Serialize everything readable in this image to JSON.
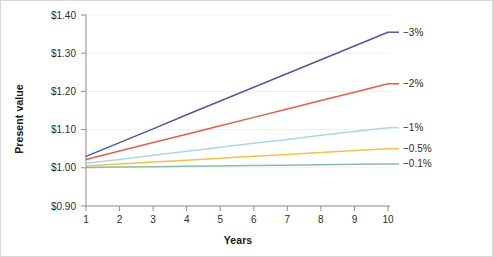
{
  "chart_data": {
    "type": "line",
    "title": "",
    "xlabel": "Years",
    "ylabel": "Present value",
    "xlim": [
      1,
      10
    ],
    "ylim": [
      0.9,
      1.4
    ],
    "grid": true,
    "legend_position": "right-inline-labels",
    "x": [
      1,
      2,
      3,
      4,
      5,
      6,
      7,
      8,
      9,
      10
    ],
    "xticklabels": [
      "1",
      "2",
      "3",
      "4",
      "5",
      "6",
      "7",
      "8",
      "9",
      "10"
    ],
    "yticks": [
      0.9,
      1.0,
      1.1,
      1.2,
      1.3,
      1.4
    ],
    "yticklabels": [
      "$0.90",
      "$1.00",
      "$1.10",
      "$1.20",
      "$1.30",
      "$1.40"
    ],
    "series": [
      {
        "name": "−3%",
        "label": "−3%",
        "color": "#4f5b93",
        "values": [
          1.03,
          1.066,
          1.102,
          1.139,
          1.175,
          1.211,
          1.247,
          1.283,
          1.319,
          1.355
        ]
      },
      {
        "name": "−2%",
        "label": "−2%",
        "color": "#d9624a",
        "values": [
          1.022,
          1.044,
          1.066,
          1.088,
          1.11,
          1.132,
          1.154,
          1.176,
          1.198,
          1.22
        ]
      },
      {
        "name": "−1%",
        "label": "−1%",
        "color": "#a9d6ec",
        "values": [
          1.012,
          1.022,
          1.033,
          1.043,
          1.054,
          1.064,
          1.074,
          1.085,
          1.095,
          1.105
        ]
      },
      {
        "name": "−0.5%",
        "label": "−0.5%",
        "color": "#f2c14a",
        "values": [
          1.005,
          1.01,
          1.015,
          1.02,
          1.025,
          1.03,
          1.035,
          1.04,
          1.045,
          1.05
        ]
      },
      {
        "name": "−0.1%",
        "label": "−0.1%",
        "color": "#8ebc9e",
        "values": [
          1.001,
          1.002,
          1.003,
          1.004,
          1.005,
          1.006,
          1.007,
          1.008,
          1.009,
          1.01
        ]
      }
    ]
  }
}
